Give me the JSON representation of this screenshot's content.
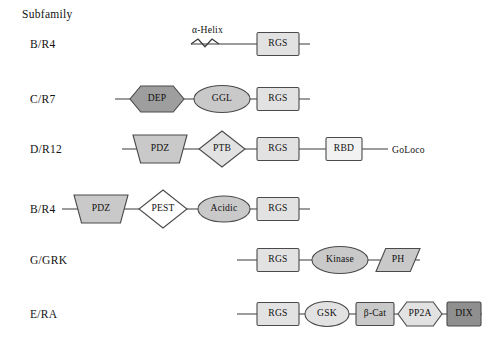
{
  "header": {
    "subfamily_label": "Subfamily"
  },
  "palette": {
    "fill_light": "#e2e2e2",
    "fill_white": "#ffffff",
    "fill_medium": "#c9c9c9",
    "fill_dark": "#9e9e9e",
    "fill_darker": "#8f8f8f",
    "stroke": "#4a4a4a",
    "line": "#3a3a3a",
    "text": "#111111",
    "background": "#ffffff"
  },
  "rows": [
    {
      "id": "row-b-r4-top",
      "label": "B/R4",
      "label_x": 30,
      "y": 44,
      "annotations": [
        {
          "name": "alpha-helix-label",
          "text": "α-Helix",
          "x": 192,
          "y": 33
        }
      ],
      "helix": {
        "x": 191,
        "width": 28
      },
      "line_start": 191,
      "line_end": 310,
      "shapes": [
        {
          "name": "rgs-domain",
          "type": "rect",
          "label": "RGS",
          "cx": 278,
          "w": 42,
          "h": 23,
          "fill": "#e2e2e2"
        }
      ]
    },
    {
      "id": "row-c-r7",
      "label": "C/R7",
      "label_x": 30,
      "y": 99,
      "annotations": [],
      "line_start": 115,
      "line_end": 310,
      "shapes": [
        {
          "name": "dep-domain",
          "type": "hexagon",
          "label": "DEP",
          "cx": 157,
          "w": 54,
          "h": 26,
          "fill": "#9e9e9e"
        },
        {
          "name": "ggl-domain",
          "type": "ellipse",
          "label": "GGL",
          "cx": 222,
          "w": 56,
          "h": 27,
          "fill": "#c9c9c9"
        },
        {
          "name": "rgs-domain",
          "type": "rect",
          "label": "RGS",
          "cx": 278,
          "w": 42,
          "h": 23,
          "fill": "#e2e2e2"
        }
      ]
    },
    {
      "id": "row-d-r12",
      "label": "D/R12",
      "label_x": 30,
      "y": 149,
      "annotations": [
        {
          "name": "goloco-label",
          "text": "GoLoco",
          "x": 392,
          "y": 153
        }
      ],
      "line_start": 122,
      "line_end": 388,
      "shapes": [
        {
          "name": "pdz-domain",
          "type": "trapezoid",
          "label": "PDZ",
          "cx": 160,
          "w": 54,
          "h": 28,
          "fill": "#c9c9c9"
        },
        {
          "name": "ptb-domain",
          "type": "diamond",
          "label": "PTB",
          "cx": 222,
          "w": 46,
          "h": 36,
          "fill": "#e2e2e2"
        },
        {
          "name": "rgs-domain",
          "type": "rect",
          "label": "RGS",
          "cx": 278,
          "w": 42,
          "h": 23,
          "fill": "#e2e2e2"
        },
        {
          "name": "rbd-domain",
          "type": "rect",
          "label": "RBD",
          "cx": 344,
          "w": 36,
          "h": 23,
          "fill": "#f2f2f2"
        }
      ]
    },
    {
      "id": "row-b-r4-bottom",
      "label": "B/R4",
      "label_x": 30,
      "y": 209,
      "annotations": [],
      "line_start": 62,
      "line_end": 310,
      "shapes": [
        {
          "name": "pdz-domain",
          "type": "trapezoid",
          "label": "PDZ",
          "cx": 101,
          "w": 54,
          "h": 28,
          "fill": "#c9c9c9"
        },
        {
          "name": "pest-domain",
          "type": "diamond",
          "label": "PEST",
          "cx": 163,
          "w": 48,
          "h": 38,
          "fill": "#ffffff"
        },
        {
          "name": "acidic-domain",
          "type": "ellipse",
          "label": "Acidic",
          "cx": 224,
          "w": 52,
          "h": 26,
          "fill": "#c9c9c9"
        },
        {
          "name": "rgs-domain",
          "type": "rect",
          "label": "RGS",
          "cx": 278,
          "w": 42,
          "h": 23,
          "fill": "#e2e2e2"
        }
      ]
    },
    {
      "id": "row-g-grk",
      "label": "G/GRK",
      "label_x": 30,
      "y": 260,
      "annotations": [],
      "line_start": 237,
      "line_end": 420,
      "shapes": [
        {
          "name": "rgs-domain",
          "type": "rect",
          "label": "RGS",
          "cx": 278,
          "w": 42,
          "h": 23,
          "fill": "#e2e2e2"
        },
        {
          "name": "kinase-domain",
          "type": "ellipse",
          "label": "Kinase",
          "cx": 340,
          "w": 56,
          "h": 27,
          "fill": "#c9c9c9"
        },
        {
          "name": "ph-domain",
          "type": "parallelogram",
          "label": "PH",
          "cx": 398,
          "w": 44,
          "h": 23,
          "fill": "#c9c9c9"
        }
      ]
    },
    {
      "id": "row-e-ra",
      "label": "E/RA",
      "label_x": 30,
      "y": 314,
      "annotations": [],
      "line_start": 237,
      "line_end": 482,
      "shapes": [
        {
          "name": "rgs-domain",
          "type": "rect",
          "label": "RGS",
          "cx": 278,
          "w": 42,
          "h": 23,
          "fill": "#e2e2e2"
        },
        {
          "name": "gsk-domain",
          "type": "ellipse",
          "label": "GSK",
          "cx": 327,
          "w": 44,
          "h": 25,
          "fill": "#e2e2e2"
        },
        {
          "name": "beta-cat-domain",
          "type": "rect",
          "label": "β-Cat",
          "cx": 375,
          "w": 38,
          "h": 23,
          "fill": "#c9c9c9"
        },
        {
          "name": "pp2a-domain",
          "type": "hexagon",
          "label": "PP2A",
          "cx": 420,
          "w": 44,
          "h": 24,
          "fill": "#e2e2e2"
        },
        {
          "name": "dix-domain",
          "type": "rect",
          "label": "DIX",
          "cx": 464,
          "w": 34,
          "h": 24,
          "fill": "#8f8f8f"
        }
      ]
    }
  ]
}
